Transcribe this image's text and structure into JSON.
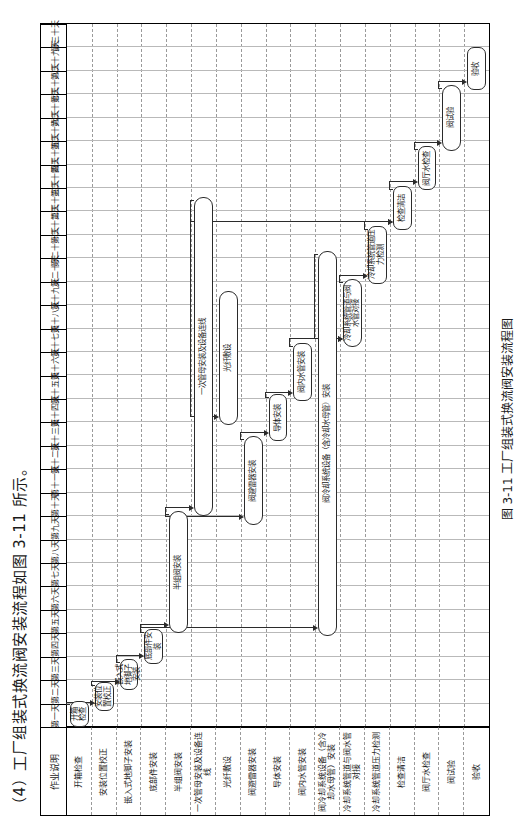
{
  "document": {
    "intro_text": "（4）工厂组装式换流阀安装流程如图 3-11 所示。",
    "caption": "图 3-11  工厂组装式换流阀安装流程图"
  },
  "chart_data": {
    "type": "table",
    "title": "工厂组装式换流阀安装流程图",
    "xlabel": "作业天数",
    "ylabel": "作业说明",
    "corner_label": "作业说明",
    "categories": [
      "第一天",
      "第二天",
      "第三天",
      "第四天",
      "第五天",
      "第六天",
      "第七天",
      "第八天",
      "第九天",
      "第十天",
      "第十一天",
      "第十二天",
      "第十三天",
      "第十四天",
      "第十五天",
      "第十六天",
      "第十七天",
      "第十八天",
      "第十九天",
      "第二十天",
      "第二十一天",
      "第二十二天",
      "第二十三天",
      "第二十四天",
      "第二十五天",
      "第二十六天",
      "第二十七天",
      "第二十八天",
      "第二十九天",
      "第三十天"
    ],
    "rows": [
      {
        "label": "开箱检查",
        "start": 0,
        "end": 1.1
      },
      {
        "label": "安装位置校正",
        "start": 0.7,
        "end": 1.9
      },
      {
        "label": "嵌入式地脚子安装",
        "start": 1.6,
        "end": 2.9
      },
      {
        "label": "底部件安装",
        "start": 2.7,
        "end": 4.2
      },
      {
        "label": "半组阀安装",
        "start": 4.0,
        "end": 9.2
      },
      {
        "label": "一次管母安装及设备连线",
        "start": 9.0,
        "end": 22.6
      },
      {
        "label": "光纤敷设",
        "start": 12.9,
        "end": 18.6
      },
      {
        "label": "阀避雷器安装",
        "start": 8.6,
        "end": 12.4
      },
      {
        "label": "导体安装",
        "start": 12.2,
        "end": 14.2
      },
      {
        "label": "阀内水管安装",
        "start": 13.9,
        "end": 16.4
      },
      {
        "label": "阀冷却系统设备（含冷却水母管）安装",
        "start": 3.9,
        "end": 20.3
      },
      {
        "label": "冷却系统管道与阀水管对接",
        "start": 16.2,
        "end": 19.1
      },
      {
        "label": "冷却系统管道压力检测",
        "start": 18.9,
        "end": 21.4
      },
      {
        "label": "检查清洁",
        "start": 21.2,
        "end": 23.1
      },
      {
        "label": "阀厅水检查",
        "start": 22.9,
        "end": 24.8
      },
      {
        "label": "阀试验",
        "start": 24.6,
        "end": 27.4
      },
      {
        "label": "验收",
        "start": 27.2,
        "end": 29.0
      }
    ],
    "axis": {
      "grid": true,
      "legend": "none",
      "xlim": [
        0,
        30
      ]
    }
  },
  "tasks": [
    {
      "id": "t0",
      "label": "开箱检查"
    },
    {
      "id": "t1",
      "label": "安装位置校正"
    },
    {
      "id": "t2",
      "label": "嵌入式地脚子安装"
    },
    {
      "id": "t3",
      "label": "底部件安装"
    },
    {
      "id": "t4",
      "label": "半组阀安装"
    },
    {
      "id": "t5",
      "label": "一次管母安装及设备连线"
    },
    {
      "id": "t6",
      "label": "光纤敷设"
    },
    {
      "id": "t7",
      "label": "阀避雷器安装"
    },
    {
      "id": "t8",
      "label": "导体安装"
    },
    {
      "id": "t9",
      "label": "阀内水管安装"
    },
    {
      "id": "t10",
      "label": "阀冷却系统设备（含冷却水母管）安装"
    },
    {
      "id": "t11",
      "label": "冷却系统管道与阀水管对接"
    },
    {
      "id": "t12",
      "label": "冷却系统管道压力检测"
    },
    {
      "id": "t13",
      "label": "检查清洁"
    },
    {
      "id": "t14",
      "label": "阀厅水检查"
    },
    {
      "id": "t15",
      "label": "阀试验"
    },
    {
      "id": "t16",
      "label": "验收"
    }
  ],
  "colors": {
    "ink": "#1a1a1a",
    "box_border": "#2b2b2b",
    "grid_solid": "#000000",
    "grid_dashed": "#9a9a9a",
    "page_bg": "#ffffff"
  }
}
